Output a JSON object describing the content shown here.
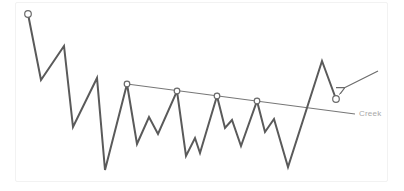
{
  "diagram": {
    "type": "price-action-schematic",
    "colors": {
      "price_line": "#5a5a5a",
      "creek_line": "#777777",
      "marker_fill": "#ffffff",
      "marker_stroke": "#6a6a6a",
      "label": "#a8a8a8",
      "arrow": "#6a6a6a",
      "frame": "#f2f2f2"
    },
    "price_path": [
      [
        28,
        14
      ],
      [
        41,
        80
      ],
      [
        64,
        46
      ],
      [
        73,
        127
      ],
      [
        97,
        78
      ],
      [
        105,
        170
      ],
      [
        127,
        84
      ],
      [
        137,
        144
      ],
      [
        149,
        117
      ],
      [
        158,
        134
      ],
      [
        177,
        91
      ],
      [
        186,
        156
      ],
      [
        195,
        138
      ],
      [
        200,
        153
      ],
      [
        217,
        96
      ],
      [
        225,
        128
      ],
      [
        232,
        120
      ],
      [
        241,
        146
      ],
      [
        257,
        101
      ],
      [
        265,
        132
      ],
      [
        274,
        119
      ],
      [
        288,
        167
      ],
      [
        322,
        61
      ],
      [
        336,
        99
      ]
    ],
    "markers": [
      {
        "name": "start-point",
        "x": 28,
        "y": 14
      },
      {
        "name": "creek-touch-1",
        "x": 127,
        "y": 84
      },
      {
        "name": "creek-touch-2",
        "x": 177,
        "y": 91
      },
      {
        "name": "creek-touch-3",
        "x": 217,
        "y": 96
      },
      {
        "name": "creek-touch-4",
        "x": 257,
        "y": 101
      },
      {
        "name": "end-point",
        "x": 336,
        "y": 99
      }
    ],
    "creek_line": {
      "x1": 127,
      "y1": 84,
      "x2": 355,
      "y2": 114
    },
    "creek_label": {
      "text": "Creek",
      "x": 359,
      "y": 109
    },
    "arrow": {
      "x1": 378,
      "y1": 71,
      "x2": 344,
      "y2": 88
    }
  }
}
